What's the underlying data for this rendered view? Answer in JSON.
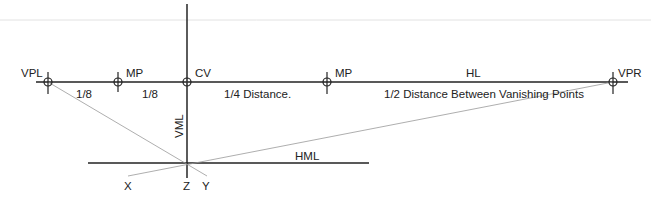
{
  "labels": {
    "vpl": "VPL",
    "mp_left": "MP",
    "cv": "CV",
    "mp_right": "MP",
    "hl": "HL",
    "vpr": "VPR",
    "seg1": "1/8",
    "seg2": "1/8",
    "seg3": "1/4 Distance.",
    "seg4": "1/2 Distance Between Vanishing Points",
    "vml": "VML",
    "hml": "HML",
    "x": "X",
    "z": "Z",
    "y": "Y"
  },
  "colors": {
    "line": "#222222",
    "thin_line": "#888888",
    "faint_line": "#dddddd",
    "text": "#222222"
  }
}
